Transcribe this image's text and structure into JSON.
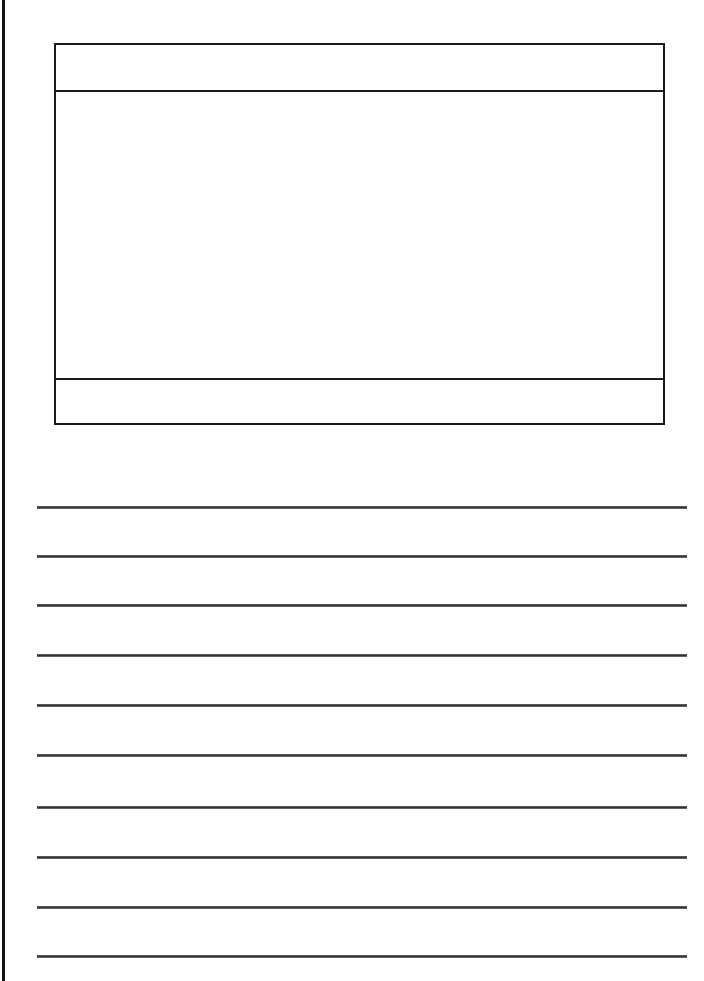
{
  "page": {
    "type": "primary writing paper with picture box",
    "colors": {
      "background": "#ffffff",
      "ink": "#1a1a1a",
      "rule_line": "#444444"
    }
  },
  "picture_box": {
    "title_field": "",
    "drawing_area": "",
    "caption_field": ""
  },
  "writing_lines": [
    {
      "y": 507,
      "text": ""
    },
    {
      "y": 556,
      "text": ""
    },
    {
      "y": 605,
      "text": ""
    },
    {
      "y": 655,
      "text": ""
    },
    {
      "y": 705,
      "text": ""
    },
    {
      "y": 755,
      "text": ""
    },
    {
      "y": 807,
      "text": ""
    },
    {
      "y": 857,
      "text": ""
    },
    {
      "y": 907,
      "text": ""
    },
    {
      "y": 956,
      "text": ""
    }
  ]
}
